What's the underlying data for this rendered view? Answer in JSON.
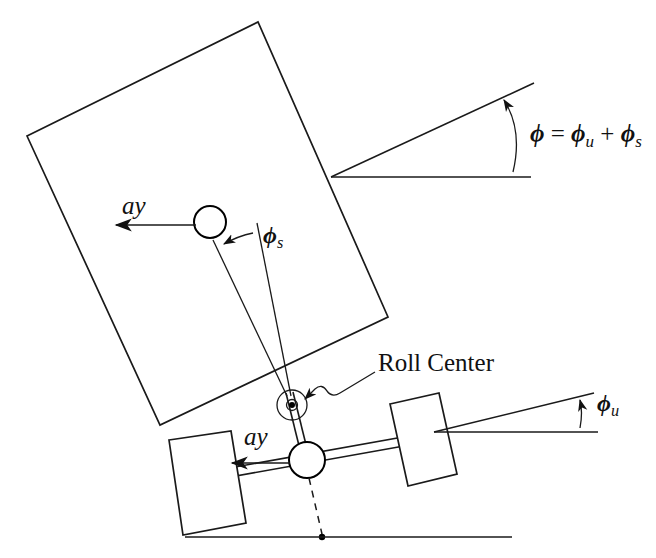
{
  "figure": {
    "background_color": "#ffffff",
    "line_color": "#1a1a1a",
    "width": 656,
    "height": 558
  },
  "labels": {
    "roll_center": "Roll Center",
    "ay_sprung": "ay",
    "ay_unsprung": "ay",
    "phi_symbol": "ϕ",
    "phi_u_sub": "u",
    "phi_s_sub": "s",
    "equals": "=",
    "plus": "+",
    "phi_total_equation": "ϕ = ϕu + ϕs"
  },
  "annotations": [
    {
      "name": "total-roll-angle",
      "text": "ϕ = ϕu + ϕs",
      "description": "Total roll angle of the sprung mass relative to ground",
      "x": 530,
      "y": 138
    },
    {
      "name": "unsprung-roll-angle",
      "text": "ϕu",
      "description": "Unsprung mass (axle) roll angle relative to ground",
      "x": 604,
      "y": 404
    },
    {
      "name": "sprung-roll-angle",
      "text": "ϕs",
      "description": "Sprung mass roll angle relative to the unsprung mass",
      "x": 268,
      "y": 238
    },
    {
      "name": "roll-center-callout",
      "text": "Roll Center",
      "description": "Suspension roll center marker",
      "x": 380,
      "y": 368
    },
    {
      "name": "lateral-accel-sprung",
      "text": "ay",
      "description": "Lateral acceleration at sprung mass center of gravity",
      "x": 123,
      "y": 212
    },
    {
      "name": "lateral-accel-unsprung",
      "text": "ay",
      "description": "Lateral acceleration at unsprung mass center of gravity",
      "x": 246,
      "y": 443
    }
  ],
  "geometry": {
    "sprung_body": {
      "name": "sprung-mass-body",
      "points": "27,136 258,22 388,317 160,425"
    },
    "ground_line": {
      "x1": 185,
      "y1": 537,
      "x2": 512,
      "y2": 537
    },
    "phi_wedge": {
      "apex_x": 331,
      "apex_y": 176,
      "horizontal_x": 531,
      "horizontal_y": 177,
      "slant_x": 533,
      "slant_y": 84
    },
    "phi_u_wedge": {
      "apex_x": 434,
      "apex_y": 432,
      "horizontal_x": 598,
      "horizontal_y": 432,
      "slant_x": 592,
      "slant_y": 394
    },
    "sprung_cg": {
      "cx": 210,
      "cy": 222,
      "r": 16
    },
    "unsprung_cg": {
      "cx": 307,
      "cy": 460,
      "r": 18
    },
    "roll_center": {
      "cx": 292,
      "cy": 405,
      "r_outer": 15,
      "r_inner": 5,
      "r_dot": 3.2
    },
    "left_wheel": {
      "points": "169,440 231,431 246,523 183,535"
    },
    "right_wheel": {
      "points": "390,404 439,393 457,474 408,486"
    }
  }
}
